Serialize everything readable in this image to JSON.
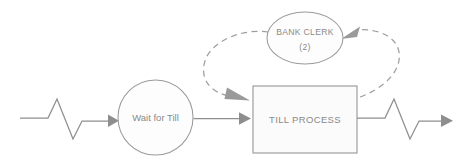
{
  "diagram": {
    "type": "process-flow",
    "background_color": "#ffffff",
    "stroke_color": "#8e8e8e",
    "shape_stroke_color": "#9a9a9a",
    "text_color": "#8a8a8a",
    "dashed_stroke_color": "#9e9e9e",
    "nodes": [
      {
        "id": "wait-for-till",
        "shape": "circle",
        "label": "Wait for Till",
        "cx": 155.5,
        "cy": 117.5,
        "r": 37.5
      },
      {
        "id": "till-process",
        "shape": "rectangle",
        "label": "TILL PROCESS",
        "x": 253,
        "y": 86,
        "width": 104,
        "height": 67
      },
      {
        "id": "bank-clerk",
        "shape": "ellipse",
        "label_line1": "BANK CLERK",
        "label_line2": "(2)",
        "cx": 305,
        "cy": 38,
        "rx": 38,
        "ry": 26
      }
    ],
    "connectors": [
      {
        "id": "inflow-zigzag",
        "style": "solid",
        "from": "source-boundary",
        "to": "wait-for-till",
        "arrow": true
      },
      {
        "id": "wait-to-till",
        "style": "solid",
        "from": "wait-for-till",
        "to": "till-process",
        "arrow": true
      },
      {
        "id": "clerk-to-till",
        "style": "dashed",
        "from": "bank-clerk",
        "to": "till-process",
        "arrow": true
      },
      {
        "id": "till-to-clerk",
        "style": "dashed",
        "from": "till-process",
        "to": "bank-clerk",
        "arrow": true
      },
      {
        "id": "outflow-zigzag",
        "style": "solid",
        "from": "till-process",
        "to": "sink-boundary",
        "arrow": true
      }
    ]
  }
}
